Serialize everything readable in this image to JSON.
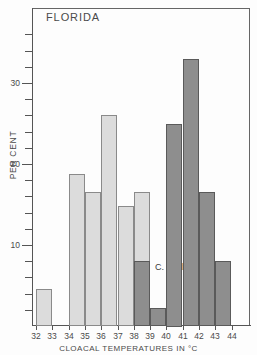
{
  "chart_data": {
    "type": "bar",
    "title": "FLORIDA",
    "xlabel": "CLOACAL TEMPERATURES IN °C",
    "ylabel": "PER CENT",
    "xlim": [
      32,
      44
    ],
    "ylim": [
      0,
      36
    ],
    "grid": false,
    "legend_position": "inline-annotation",
    "xtick_labels": [
      "32",
      "33",
      "34",
      "35",
      "36",
      "37",
      "38",
      "39",
      "40",
      "41",
      "42",
      "43",
      "44"
    ],
    "ytick_labels": [
      "10",
      "20",
      "30"
    ],
    "ytick_values": [
      10,
      20,
      30
    ],
    "minor_tick_step": 2,
    "bin_width": 1,
    "series": [
      {
        "name": "S. Woodi",
        "color": "#dcdcdc",
        "bins": [
          {
            "x0": 32,
            "x1": 33,
            "value": 4.6
          },
          {
            "x0": 34,
            "x1": 35,
            "value": 18.8
          },
          {
            "x0": 35,
            "x1": 36,
            "value": 16.5
          },
          {
            "x0": 36,
            "x1": 37,
            "value": 26.0
          },
          {
            "x0": 37,
            "x1": 38,
            "value": 14.8
          },
          {
            "x0": 38,
            "x1": 39,
            "value": 16.5
          }
        ]
      },
      {
        "name": "C. Sexlineatus",
        "color": "#8e8e8e",
        "bins": [
          {
            "x0": 38,
            "x1": 39,
            "value": 8.0
          },
          {
            "x0": 39,
            "x1": 40,
            "value": 2.2
          },
          {
            "x0": 40,
            "x1": 41,
            "value": 25.0
          },
          {
            "x0": 41,
            "x1": 42,
            "value": 33.0
          },
          {
            "x0": 42,
            "x1": 43,
            "value": 16.5
          },
          {
            "x0": 43,
            "x1": 44,
            "value": 8.0
          }
        ]
      }
    ]
  }
}
